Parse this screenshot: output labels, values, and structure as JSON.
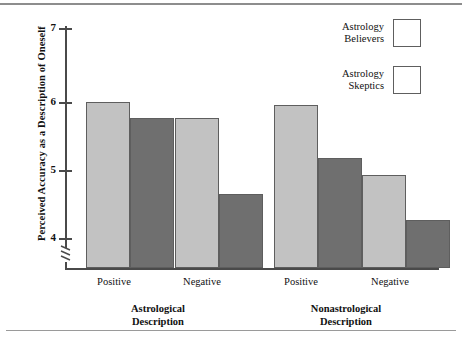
{
  "chart_data": {
    "type": "bar",
    "title": "",
    "xlabel": "",
    "ylabel": "Perceived Accuracy as a Description of Oneself",
    "ylim": [
      3.6,
      7.0
    ],
    "yticks": [
      4,
      5,
      6,
      7
    ],
    "ytick_labels": [
      "4",
      "5",
      "6",
      "7"
    ],
    "y_axis_break": true,
    "grid": false,
    "legend_position": "top-right",
    "categories": [
      "Positive",
      "Negative",
      "Positive",
      "Negative"
    ],
    "group_labels": [
      "Astrological\nDescription",
      "Nonastrological\nDescription"
    ],
    "series": [
      {
        "name": "Astrology Believers",
        "color": "#c2c2c2",
        "values": [
          6.0,
          5.77,
          5.95,
          4.93
        ]
      },
      {
        "name": "Astrology Skeptics",
        "color": "#6f6f6f",
        "values": [
          5.76,
          4.65,
          5.18,
          4.26
        ]
      }
    ]
  },
  "axis": {
    "y_title": "Perceived Accuracy as a Description of Oneself",
    "tick_7": "7",
    "tick_6": "6",
    "tick_5": "5",
    "tick_4": "4"
  },
  "xlabels": {
    "g1_positive": "Positive",
    "g1_negative": "Negative",
    "g2_positive": "Positive",
    "g2_negative": "Negative",
    "group1_line1": "Astrological",
    "group1_line2": "Description",
    "group2_line1": "Nonastrological",
    "group2_line2": "Description"
  },
  "legend": {
    "believers_line1": "Astrology",
    "believers_line2": "Believers",
    "skeptics_line1": "Astrology",
    "skeptics_line2": "Skeptics",
    "believers_color": "#c2c2c2",
    "skeptics_color": "#6f6f6f"
  }
}
